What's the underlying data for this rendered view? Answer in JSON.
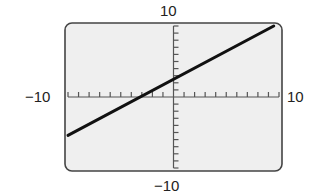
{
  "chart_data": {
    "type": "line",
    "title": "",
    "xlabel": "",
    "ylabel": "",
    "xlim": [
      -10,
      10
    ],
    "ylim": [
      -10,
      10
    ],
    "x_tick_step": 1,
    "y_tick_step": 1,
    "grid": false,
    "window_labels": {
      "xmin": "−10",
      "xmax": "10",
      "ymin": "−10",
      "ymax": "10"
    },
    "series": [
      {
        "name": "line",
        "x": [
          -10,
          9.5
        ],
        "y": [
          -5.4,
          10
        ],
        "x_intercept": -3,
        "y_intercept": 2.4
      }
    ]
  },
  "colors": {
    "screen_bg": "#efefef",
    "frame": "#444444",
    "axis": "#555555",
    "line": "#111111"
  }
}
